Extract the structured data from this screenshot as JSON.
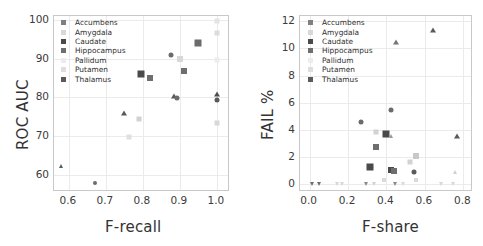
{
  "figure": {
    "panels": [
      {
        "id": "left",
        "legend": {
          "entries": [
            {
              "label": "Accumbens",
              "color": "#808080",
              "marker": "square"
            },
            {
              "label": "Amygdala",
              "color": "#d8d8d8",
              "marker": "square"
            },
            {
              "label": "Caudate",
              "color": "#4a4a4a",
              "marker": "square"
            },
            {
              "label": "Hippocampus",
              "color": "#6e6e6e",
              "marker": "square"
            },
            {
              "label": "Pallidum",
              "color": "#ececec",
              "marker": "square"
            },
            {
              "label": "Putamen",
              "color": "#dedede",
              "marker": "square"
            },
            {
              "label": "Thalamus",
              "color": "#5a5a5a",
              "marker": "square"
            }
          ]
        },
        "chart_data": {
          "type": "scatter",
          "title": "",
          "xlabel": "F-recall",
          "ylabel": "ROC AUC",
          "xlim": [
            0.56,
            1.03
          ],
          "ylim": [
            56,
            101
          ],
          "xticks": [
            0.6,
            0.7,
            0.8,
            0.9,
            1.0
          ],
          "xticklabels": [
            "0.6",
            "0.7",
            "0.8",
            "0.9",
            "1.0"
          ],
          "yticks": [
            60,
            70,
            80,
            90,
            100
          ],
          "yticklabels": [
            "60",
            "70",
            "80",
            "90",
            "100"
          ],
          "grid": true,
          "legend_position": "upper left",
          "points": [
            {
              "x": 0.58,
              "y": 62.1,
              "group": "Thalamus",
              "marker": "triangle-up",
              "color": "#5a5a5a",
              "size": 4
            },
            {
              "x": 0.67,
              "y": 57.8,
              "group": "Accumbens",
              "marker": "circle",
              "color": "#6b6b6b",
              "size": 4
            },
            {
              "x": 0.75,
              "y": 76.0,
              "group": "Thalamus",
              "marker": "triangle-up",
              "color": "#5a5a5a",
              "size": 5
            },
            {
              "x": 0.762,
              "y": 69.7,
              "group": "Pallidum",
              "marker": "square",
              "color": "#e0e0e0",
              "size": 5
            },
            {
              "x": 0.79,
              "y": 74.4,
              "group": "Putamen",
              "marker": "square",
              "color": "#d2d2d2",
              "size": 5
            },
            {
              "x": 0.795,
              "y": 85.9,
              "group": "Caudate",
              "marker": "square",
              "color": "#4a4a4a",
              "size": 7
            },
            {
              "x": 0.82,
              "y": 85.0,
              "group": "Hippocampus",
              "marker": "square",
              "color": "#6e6e6e",
              "size": 6
            },
            {
              "x": 0.875,
              "y": 90.8,
              "group": "Accumbens",
              "marker": "circle",
              "color": "#6b6b6b",
              "size": 5
            },
            {
              "x": 0.885,
              "y": 80.4,
              "group": "Thalamus",
              "marker": "triangle-up",
              "color": "#5a5a5a",
              "size": 5
            },
            {
              "x": 0.893,
              "y": 79.8,
              "group": "Accumbens",
              "marker": "circle",
              "color": "#6b6b6b",
              "size": 5
            },
            {
              "x": 0.9,
              "y": 90.0,
              "group": "Putamen",
              "marker": "square",
              "color": "#d8d8d8",
              "size": 6
            },
            {
              "x": 0.91,
              "y": 86.7,
              "group": "Hippocampus",
              "marker": "square",
              "color": "#6e6e6e",
              "size": 6
            },
            {
              "x": 0.948,
              "y": 94.0,
              "group": "Caudate",
              "marker": "square",
              "color": "#6b6b6b",
              "size": 7
            },
            {
              "x": 1.0,
              "y": 99.6,
              "group": "Pallidum",
              "marker": "square",
              "color": "#e4e4e4",
              "size": 5
            },
            {
              "x": 1.0,
              "y": 96.7,
              "group": "Amygdala",
              "marker": "square",
              "color": "#dcdcdc",
              "size": 5
            },
            {
              "x": 1.0,
              "y": 89.5,
              "group": "Pallidum",
              "marker": "square",
              "color": "#ececec",
              "size": 5
            },
            {
              "x": 1.0,
              "y": 80.8,
              "group": "Thalamus",
              "marker": "triangle-up",
              "color": "#4f4f4f",
              "size": 5
            },
            {
              "x": 1.0,
              "y": 79.4,
              "group": "Accumbens",
              "marker": "circle",
              "color": "#5a5a5a",
              "size": 5
            },
            {
              "x": 1.0,
              "y": 73.3,
              "group": "Putamen",
              "marker": "square",
              "color": "#d8d8d8",
              "size": 5
            }
          ]
        }
      },
      {
        "id": "right",
        "legend": {
          "entries": [
            {
              "label": "Accumbens",
              "color": "#808080",
              "marker": "square"
            },
            {
              "label": "Amygdala",
              "color": "#d8d8d8",
              "marker": "square"
            },
            {
              "label": "Caudate",
              "color": "#4a4a4a",
              "marker": "square"
            },
            {
              "label": "Hippocampus",
              "color": "#6e6e6e",
              "marker": "square"
            },
            {
              "label": "Pallidum",
              "color": "#ececec",
              "marker": "square"
            },
            {
              "label": "Putamen",
              "color": "#dedede",
              "marker": "square"
            },
            {
              "label": "Thalamus",
              "color": "#5a5a5a",
              "marker": "square"
            }
          ]
        },
        "chart_data": {
          "type": "scatter",
          "title": "",
          "xlabel": "F-share",
          "ylabel": "FAIL %",
          "xlim": [
            -0.05,
            0.84
          ],
          "ylim": [
            -0.45,
            12.4
          ],
          "xticks": [
            0.0,
            0.2,
            0.4,
            0.6,
            0.8
          ],
          "xticklabels": [
            "0.0",
            "0.2",
            "0.4",
            "0.6",
            "0.8"
          ],
          "yticks": [
            0,
            2,
            4,
            6,
            8,
            10,
            12
          ],
          "yticklabels": [
            "0",
            "2",
            "4",
            "6",
            "8",
            "10",
            "12"
          ],
          "grid": true,
          "legend_position": "upper left",
          "points": [
            {
              "x": 0.64,
              "y": 11.35,
              "group": "Thalamus",
              "marker": "triangle-up",
              "color": "#5a5a5a",
              "size": 5
            },
            {
              "x": 0.45,
              "y": 10.45,
              "group": "Thalamus",
              "marker": "triangle-up",
              "color": "#777777",
              "size": 5
            },
            {
              "x": 0.425,
              "y": 5.45,
              "group": "Accumbens",
              "marker": "circle",
              "color": "#6b6b6b",
              "size": 5
            },
            {
              "x": 0.265,
              "y": 4.55,
              "group": "Accumbens",
              "marker": "circle",
              "color": "#6b6b6b",
              "size": 5
            },
            {
              "x": 0.345,
              "y": 3.82,
              "group": "Putamen",
              "marker": "square",
              "color": "#d2d2d2",
              "size": 5
            },
            {
              "x": 0.4,
              "y": 3.72,
              "group": "Caudate",
              "marker": "square",
              "color": "#4a4a4a",
              "size": 7
            },
            {
              "x": 0.425,
              "y": 3.55,
              "group": "Thalamus",
              "marker": "triangle-up",
              "color": "#9a9a9a",
              "size": 4
            },
            {
              "x": 0.765,
              "y": 3.52,
              "group": "Thalamus",
              "marker": "triangle-up",
              "color": "#5a5a5a",
              "size": 5
            },
            {
              "x": 0.345,
              "y": 2.72,
              "group": "Hippocampus",
              "marker": "square",
              "color": "#6e6e6e",
              "size": 6
            },
            {
              "x": 0.555,
              "y": 2.08,
              "group": "Putamen",
              "marker": "square",
              "color": "#c8c8c8",
              "size": 6
            },
            {
              "x": 0.525,
              "y": 1.65,
              "group": "Putamen",
              "marker": "square",
              "color": "#d2d2d2",
              "size": 5
            },
            {
              "x": 0.312,
              "y": 1.25,
              "group": "Caudate",
              "marker": "square",
              "color": "#4a4a4a",
              "size": 7
            },
            {
              "x": 0.425,
              "y": 1.05,
              "group": "Caudate",
              "marker": "square",
              "color": "#4a4a4a",
              "size": 6
            },
            {
              "x": 0.437,
              "y": 0.92,
              "group": "Hippocampus",
              "marker": "square",
              "color": "#6e6e6e",
              "size": 6
            },
            {
              "x": 0.545,
              "y": 0.88,
              "group": "Accumbens",
              "marker": "circle",
              "color": "#5a5a5a",
              "size": 5
            },
            {
              "x": 0.755,
              "y": 0.85,
              "group": "Amygdala",
              "marker": "triangle-up",
              "color": "#cfcfcf",
              "size": 4
            },
            {
              "x": 0.552,
              "y": 0.28,
              "group": "Pallidum",
              "marker": "square",
              "color": "#dadada",
              "size": 4
            },
            {
              "x": 0.385,
              "y": 0.28,
              "group": "Pallidum",
              "marker": "square",
              "color": "#dadada",
              "size": 4
            },
            {
              "x": 0.012,
              "y": 0.0,
              "group": "Thalamus",
              "marker": "triangle-down",
              "color": "#6e6e6e",
              "size": 4
            },
            {
              "x": 0.047,
              "y": 0.0,
              "group": "Thalamus",
              "marker": "triangle-down",
              "color": "#6e6e6e",
              "size": 4
            },
            {
              "x": 0.145,
              "y": 0.0,
              "group": "Pallidum",
              "marker": "triangle-down",
              "color": "#d8d8d8",
              "size": 4
            },
            {
              "x": 0.168,
              "y": 0.0,
              "group": "Pallidum",
              "marker": "triangle-down",
              "color": "#d8d8d8",
              "size": 4
            },
            {
              "x": 0.292,
              "y": 0.0,
              "group": "Thalamus",
              "marker": "triangle-down",
              "color": "#8a8a8a",
              "size": 4
            },
            {
              "x": 0.335,
              "y": 0.0,
              "group": "Pallidum",
              "marker": "triangle-down",
              "color": "#d2d2d2",
              "size": 4
            },
            {
              "x": 0.445,
              "y": 0.0,
              "group": "Thalamus",
              "marker": "triangle-down",
              "color": "#8a8a8a",
              "size": 4
            },
            {
              "x": 0.487,
              "y": 0.0,
              "group": "Pallidum",
              "marker": "triangle-down",
              "color": "#dadada",
              "size": 4
            },
            {
              "x": 0.685,
              "y": 0.0,
              "group": "Amygdala",
              "marker": "triangle-down",
              "color": "#d8d8d8",
              "size": 4
            },
            {
              "x": 0.748,
              "y": 0.0,
              "group": "Amygdala",
              "marker": "triangle-down",
              "color": "#d8d8d8",
              "size": 4
            }
          ]
        }
      }
    ]
  }
}
